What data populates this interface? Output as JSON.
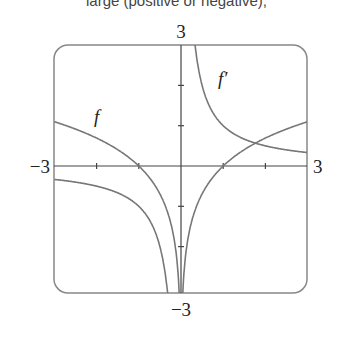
{
  "caption": "large (positive or negative),",
  "chart_data": {
    "type": "line",
    "title": "",
    "xlabel": "",
    "ylabel": "",
    "xlim": [
      -3,
      3
    ],
    "ylim": [
      -3,
      3
    ],
    "x_tick_labels": [
      "-3",
      "3"
    ],
    "y_tick_labels": [
      "3",
      "-3"
    ],
    "x_ticks": [
      -3,
      -2,
      -1,
      0,
      1,
      2,
      3
    ],
    "y_ticks": [
      -3,
      -2,
      -1,
      0,
      1,
      2,
      3
    ],
    "grid": false,
    "series": [
      {
        "name": "f",
        "label": "f",
        "formula": "ln|x|",
        "points": [
          [
            -3,
            1.1
          ],
          [
            -2,
            0.69
          ],
          [
            -1,
            0
          ],
          [
            -0.5,
            -0.69
          ],
          [
            -0.1,
            -2.3
          ],
          [
            -0.05,
            -3
          ],
          [
            0.05,
            -3
          ],
          [
            0.1,
            -2.3
          ],
          [
            0.5,
            -0.69
          ],
          [
            1,
            0
          ],
          [
            2,
            0.69
          ],
          [
            3,
            1.1
          ]
        ]
      },
      {
        "name": "f'",
        "label": "f′",
        "formula": "1/x",
        "points": [
          [
            -3,
            -0.33
          ],
          [
            -2,
            -0.5
          ],
          [
            -1,
            -1
          ],
          [
            -0.5,
            -2
          ],
          [
            -0.33,
            -3
          ],
          [
            0.33,
            3
          ],
          [
            0.5,
            2
          ],
          [
            1,
            1
          ],
          [
            2,
            0.5
          ],
          [
            3,
            0.33
          ]
        ]
      }
    ],
    "annotations": [
      {
        "text": "f",
        "x": -1.5,
        "y": 1.2
      },
      {
        "text": "f′",
        "x": 0.9,
        "y": 2.1
      }
    ]
  },
  "labels": {
    "x_min": "−3",
    "x_max": "3",
    "y_max": "3",
    "y_min": "−3",
    "f": "f",
    "fprime": "f′"
  }
}
